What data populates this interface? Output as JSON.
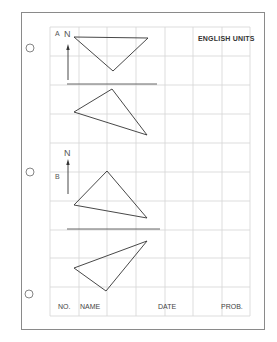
{
  "header": {
    "units_label": "ENGLISH UNITS"
  },
  "sections": [
    {
      "id": "A",
      "label": "A",
      "north_label": "N",
      "triangles": [
        [
          [
            74,
            37
          ],
          [
            148,
            38
          ],
          [
            113,
            71
          ]
        ],
        [
          [
            112,
            89
          ],
          [
            74,
            112
          ],
          [
            147,
            135
          ]
        ]
      ]
    },
    {
      "id": "B",
      "label": "B",
      "north_label": "N",
      "triangles": [
        [
          [
            107,
            171
          ],
          [
            74,
            205
          ],
          [
            147,
            218
          ]
        ],
        [
          [
            147,
            241
          ],
          [
            74,
            268
          ],
          [
            106,
            291
          ]
        ]
      ]
    }
  ],
  "footer": {
    "no_label": "NO.",
    "name_label": "NAME",
    "date_label": "DATE",
    "prob_label": "PROB."
  },
  "colors": {
    "grid": "#d4d4d4",
    "ink": "#333333",
    "border": "#8a8a8a"
  }
}
